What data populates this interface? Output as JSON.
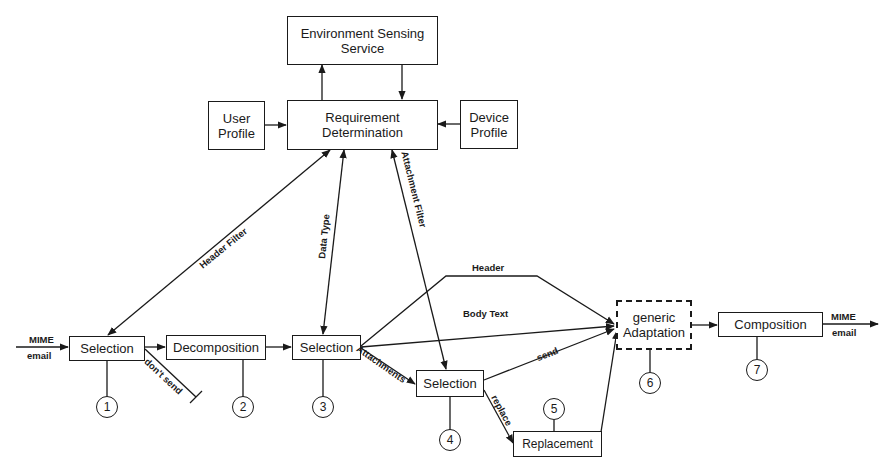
{
  "boxes": {
    "env_sensing": "Environment Sensing Service",
    "env_sensing_line1": "Environment Sensing",
    "env_sensing_line2": "Service",
    "user_profile_line1": "User",
    "user_profile_line2": "Profile",
    "req_det_line1": "Requirement",
    "req_det_line2": "Determination",
    "device_profile_line1": "Device",
    "device_profile_line2": "Profile",
    "selection1": "Selection",
    "decomposition": "Decomposition",
    "selection3": "Selection",
    "selection4": "Selection",
    "replacement": "Replacement",
    "generic_adaptation_line1": "generic",
    "generic_adaptation_line2": "Adaptation",
    "composition": "Composition"
  },
  "edge_labels": {
    "input_top": "MIME",
    "input_bottom": "email",
    "output_top": "MIME",
    "output_bottom": "email",
    "header_filter": "Header Filter",
    "data_type": "Data Type",
    "attachment_filter": "Attachment Filter",
    "dont_send": "don't send",
    "header": "Header",
    "body_text": "Body Text",
    "attachments": "Attachments",
    "send": "send",
    "replace": "replace"
  },
  "steps": [
    "1",
    "2",
    "3",
    "4",
    "5",
    "6",
    "7"
  ],
  "colors": {
    "ink": "#1a1a1a",
    "background": "#ffffff"
  }
}
